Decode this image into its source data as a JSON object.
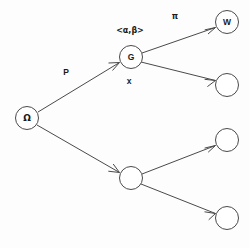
{
  "diagram": {
    "background_color": "#fdfdfd",
    "stroke_color": "#4a4a4a",
    "text_color": "#1a1a1a",
    "nodes": [
      {
        "id": "omega",
        "label": "Ω",
        "cx": 27,
        "cy": 118,
        "r": 11.5,
        "labeled": true
      },
      {
        "id": "g",
        "label": "G",
        "cx": 131,
        "cy": 57,
        "r": 11.5,
        "labeled": true
      },
      {
        "id": "b1",
        "label": "",
        "cx": 131,
        "cy": 178,
        "r": 11.5,
        "labeled": false
      },
      {
        "id": "w",
        "label": "W",
        "cx": 227,
        "cy": 22,
        "r": 11.5,
        "labeled": true
      },
      {
        "id": "r1",
        "label": "",
        "cx": 227,
        "cy": 85,
        "r": 11.5,
        "labeled": false
      },
      {
        "id": "r2",
        "label": "",
        "cx": 227,
        "cy": 140,
        "r": 11.5,
        "labeled": false
      },
      {
        "id": "r3",
        "label": "",
        "cx": 227,
        "cy": 218,
        "r": 11.5,
        "labeled": false
      }
    ],
    "edges": [
      {
        "id": "omega-g",
        "from": "omega",
        "to": "g",
        "label": "P",
        "arrow": true
      },
      {
        "id": "omega-b1",
        "from": "omega",
        "to": "b1",
        "label": "",
        "arrow": true
      },
      {
        "id": "g-w",
        "from": "g",
        "to": "w",
        "label": "π",
        "arrow": true
      },
      {
        "id": "g-r1",
        "from": "g",
        "to": "r1",
        "label": "",
        "arrow": true
      },
      {
        "id": "b1-r2",
        "from": "b1",
        "to": "r2",
        "label": "",
        "arrow": true
      },
      {
        "id": "b1-r3",
        "from": "b1",
        "to": "r3",
        "label": "",
        "arrow": true
      }
    ],
    "annotations": [
      {
        "id": "pair-label",
        "text": "<α,β>",
        "x": 130,
        "y": 30
      },
      {
        "id": "x-label",
        "text": "x",
        "x": 129,
        "y": 82
      },
      {
        "id": "p-label",
        "text": "P",
        "x": 66,
        "y": 73
      },
      {
        "id": "pi-label",
        "text": "π",
        "x": 175,
        "y": 16
      }
    ]
  }
}
